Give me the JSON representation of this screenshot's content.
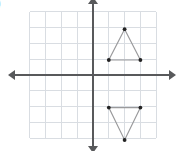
{
  "question_option": {
    "label": ")"
  },
  "graph": {
    "title": "coordinate-plane-with-two-triangles",
    "colors": {
      "grid": "#d9dde2",
      "axis": "#58595b",
      "shape_stroke": "#9a9a9c",
      "vertex": "#232323",
      "background": "#ffffff"
    },
    "axes": {
      "x_axis": {
        "name": "x-axis",
        "y_pixel": 75,
        "x_start": 14,
        "x_end": 170,
        "left_arrow": true,
        "right_arrow": true
      },
      "y_axis": {
        "name": "y-axis",
        "x_pixel": 93,
        "y_start": 3,
        "y_end": 147,
        "up_arrow": true,
        "down_arrow": true
      }
    },
    "grid": {
      "visible": true,
      "spacing_px": 15.8,
      "origin_px": [
        93,
        75
      ],
      "x_range": [
        -4,
        5
      ],
      "y_range": [
        -4,
        4
      ],
      "vertical_line_x_px": [
        29.6,
        45.4,
        61.2,
        77.1,
        93,
        108.8,
        124.6,
        140.4,
        156.2
      ],
      "horizontal_line_y_px": [
        11.8,
        27.6,
        43.4,
        59.2,
        75,
        90.8,
        106.6,
        122.4,
        138.2
      ]
    },
    "shapes": [
      {
        "name": "upper-triangle",
        "orientation": "pointing-up",
        "quadrant": "I",
        "vertices_px": [
          [
            124.6,
            29.2
          ],
          [
            108.8,
            60.0
          ],
          [
            140.4,
            60.0
          ]
        ],
        "vertices_units": [
          [
            2,
            3
          ],
          [
            1,
            1
          ],
          [
            3,
            1
          ]
        ],
        "closed": true
      },
      {
        "name": "lower-triangle",
        "orientation": "pointing-down",
        "quadrant": "IV",
        "vertices_px": [
          [
            108.8,
            107.6
          ],
          [
            140.4,
            107.6
          ],
          [
            124.6,
            140.0
          ]
        ],
        "vertices_units": [
          [
            1,
            -2
          ],
          [
            3,
            -2
          ],
          [
            2,
            -4
          ]
        ],
        "closed": true
      }
    ],
    "vertex_dots_px": [
      [
        124.6,
        29.2
      ],
      [
        108.8,
        60.0
      ],
      [
        140.4,
        60.0
      ],
      [
        108.8,
        107.6
      ],
      [
        140.4,
        107.6
      ],
      [
        124.6,
        140.0
      ]
    ]
  },
  "chart_data": {
    "type": "scatter",
    "title": "",
    "xlabel": "",
    "ylabel": "",
    "xlim": [
      -4,
      5
    ],
    "ylim": [
      -4,
      4
    ],
    "grid": true,
    "legend": "none",
    "series": [
      {
        "name": "upper-triangle",
        "x": [
          2,
          1,
          3,
          2
        ],
        "y": [
          3,
          1,
          1,
          3
        ]
      },
      {
        "name": "lower-triangle",
        "x": [
          1,
          3,
          2,
          1
        ],
        "y": [
          -2,
          -2,
          -4,
          -2
        ]
      }
    ]
  }
}
